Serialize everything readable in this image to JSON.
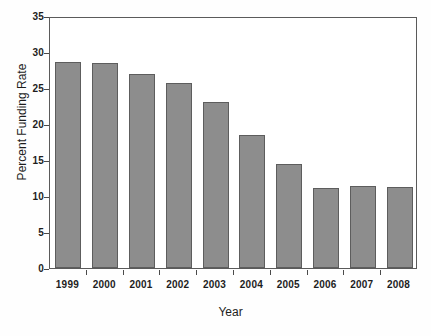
{
  "chart_data": {
    "type": "bar",
    "title": "",
    "xlabel": "Year",
    "ylabel": "Percent Funding Rate",
    "categories": [
      "1999",
      "2000",
      "2001",
      "2002",
      "2003",
      "2004",
      "2005",
      "2006",
      "2007",
      "2008"
    ],
    "values": [
      28.6,
      28.5,
      27.0,
      25.7,
      23.0,
      18.5,
      14.4,
      11.1,
      11.4,
      11.2
    ],
    "ylim": [
      0,
      35
    ],
    "yticks": [
      0,
      5,
      10,
      15,
      20,
      25,
      30,
      35
    ],
    "ytick_labels": [
      "0",
      "5",
      "10",
      "15",
      "20",
      "25",
      "30",
      "35"
    ],
    "grid": false,
    "legend": null,
    "bar_color": "#8d8d8d",
    "bar_edge_color": "#5d5d5d",
    "axis_color": "#5a5a5a",
    "background": "#ffffff"
  }
}
